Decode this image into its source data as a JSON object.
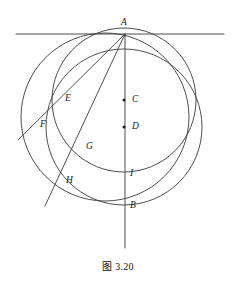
{
  "figure": {
    "caption": "图 3.20",
    "stroke_color": "#3a3a3a",
    "label_color": "#1a1a1a",
    "background_color": "#ffffff",
    "width": 236,
    "height": 292
  },
  "points": [
    {
      "id": "A",
      "label": "A",
      "x": 125,
      "y": 34,
      "label_x": 121,
      "label_y": 18,
      "dot": false
    },
    {
      "id": "C",
      "label": "C",
      "x": 124,
      "y": 100,
      "label_x": 132,
      "label_y": 95,
      "dot": true
    },
    {
      "id": "D",
      "label": "D",
      "x": 124,
      "y": 127,
      "label_x": 132,
      "label_y": 122,
      "dot": true
    },
    {
      "id": "E",
      "label": "E",
      "x": 69,
      "y": 101,
      "label_x": 65,
      "label_y": 94,
      "dot": false
    },
    {
      "id": "F",
      "label": "F",
      "x": 48,
      "y": 124,
      "label_x": 40,
      "label_y": 120,
      "dot": false
    },
    {
      "id": "G",
      "label": "G",
      "x": 84,
      "y": 146,
      "label_x": 86,
      "label_y": 142,
      "dot": false
    },
    {
      "id": "H",
      "label": "H",
      "x": 66,
      "y": 180,
      "label_x": 66,
      "label_y": 176,
      "dot": false
    },
    {
      "id": "I",
      "label": "I",
      "x": 124,
      "y": 172,
      "label_x": 130,
      "label_y": 169,
      "dot": false
    },
    {
      "id": "B",
      "label": "B",
      "x": 124,
      "y": 205,
      "label_x": 130,
      "label_y": 201,
      "dot": false
    }
  ],
  "circles": [
    {
      "id": "outer-circle",
      "name": "circle-center-D",
      "cx": 124,
      "cy": 127,
      "r": 78
    },
    {
      "id": "inner-circle",
      "name": "circle-center-C",
      "cx": 124,
      "cy": 100,
      "r": 72
    },
    {
      "id": "left-circle",
      "name": "circle-through-AEGH",
      "cx": 105,
      "cy": 117,
      "r": 84
    }
  ],
  "lines": [
    {
      "id": "tangent-line",
      "name": "horizontal-tangent-at-A",
      "x1": 16,
      "y1": 34,
      "x2": 224,
      "y2": 34
    },
    {
      "id": "vertical-line",
      "name": "vertical-diameter-A-B",
      "x1": 125,
      "y1": 34,
      "x2": 125,
      "y2": 248
    },
    {
      "id": "secant-AEF",
      "name": "secant-line-A-E-F",
      "x1": 125,
      "y1": 34,
      "x2": 18,
      "y2": 140
    },
    {
      "id": "secant-AGH",
      "name": "secant-line-A-G-H",
      "x1": 125,
      "y1": 34,
      "x2": 45,
      "y2": 206
    }
  ]
}
